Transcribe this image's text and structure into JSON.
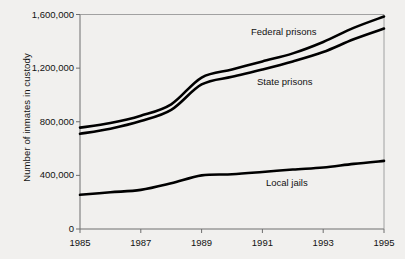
{
  "chart_data": {
    "type": "line",
    "title": "",
    "xlabel": "",
    "ylabel": "Number of inmates in custody",
    "xlim": [
      1985,
      1995
    ],
    "ylim": [
      0,
      1600000
    ],
    "grid": false,
    "legend_position": "inline-annotations",
    "x": [
      1985,
      1986,
      1987,
      1988,
      1989,
      1990,
      1991,
      1992,
      1993,
      1994,
      1995
    ],
    "xticks": [
      1985,
      1987,
      1989,
      1991,
      1993,
      1995
    ],
    "xtick_labels": [
      "1985",
      "1987",
      "1989",
      "1991",
      "1993",
      "1995"
    ],
    "yticks": [
      0,
      400000,
      800000,
      1200000,
      1600000
    ],
    "ytick_labels": [
      "0",
      "400,000",
      "800,000",
      "1,200,000",
      "1,600,000"
    ],
    "series": [
      {
        "name": "Federal prisons",
        "label": "Federal prisons",
        "color": "#000000",
        "values": [
          756000,
          790000,
          845000,
          930000,
          1130000,
          1190000,
          1250000,
          1310000,
          1395000,
          1500000,
          1585000
        ]
      },
      {
        "name": "State prisons",
        "label": "State prisons",
        "color": "#000000",
        "values": [
          710000,
          748000,
          805000,
          888000,
          1078000,
          1135000,
          1190000,
          1250000,
          1320000,
          1415000,
          1495000
        ]
      },
      {
        "name": "Local jails",
        "label": "Local jails",
        "color": "#000000",
        "values": [
          255000,
          274000,
          292000,
          341000,
          400000,
          408000,
          425000,
          444000,
          459000,
          486000,
          508000
        ]
      }
    ],
    "annotations": [
      {
        "text": "Federal prisons",
        "x_px": 251,
        "y_px": 26
      },
      {
        "text": "State prisons",
        "x_px": 257,
        "y_px": 76
      },
      {
        "text": "Local jails",
        "x_px": 266,
        "y_px": 177
      }
    ]
  }
}
